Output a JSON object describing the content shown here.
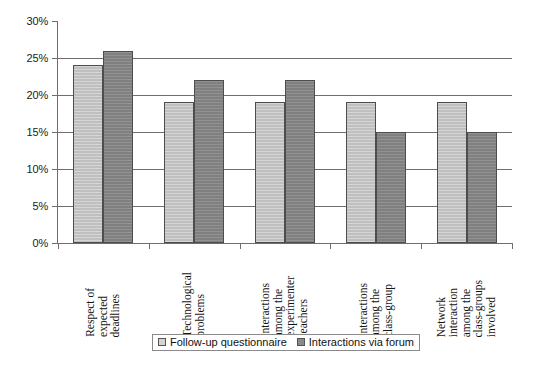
{
  "chart_data": {
    "type": "bar",
    "title": "",
    "subtitle": "",
    "xlabel": "",
    "ylabel": "",
    "ylim": [
      0,
      30
    ],
    "ytick_values": [
      30,
      25,
      20,
      15,
      10,
      5,
      0
    ],
    "ytick_labels": [
      "30%",
      "25%",
      "20%",
      "15%",
      "10%",
      "5%",
      "0%"
    ],
    "grid": true,
    "grid_axis": "y",
    "legend_position": "bottom",
    "categories": [
      "Respect of expected deadlines",
      "Technological problems",
      "Interactions among the experimenter teachers",
      "Interactions among the class-group",
      "Network interaction among the class-groups involved"
    ],
    "category_label_lines": [
      [
        "Respect of",
        "expected",
        "deadlines"
      ],
      [
        "Technological",
        "problems"
      ],
      [
        "Interactions",
        "among the",
        "experimenter",
        "teachers"
      ],
      [
        "Interactions",
        "among the",
        "class-group"
      ],
      [
        "Network",
        "interaction",
        "among the",
        "class-groups",
        "involved"
      ]
    ],
    "series": [
      {
        "name": "Follow-up questionnaire",
        "color": "#bfbfbf",
        "values": [
          24,
          19,
          19,
          19,
          19
        ]
      },
      {
        "name": "Interactions via forum",
        "color": "#808080",
        "values": [
          26,
          22,
          22,
          15,
          15
        ]
      }
    ]
  },
  "legend": {
    "items": [
      {
        "label": "Follow-up questionnaire",
        "series": 0
      },
      {
        "label": "Interactions via forum",
        "series": 1
      }
    ]
  },
  "colors": {
    "series_0": "#bfbfbf",
    "series_1": "#808080",
    "axis": "#6e6e6e",
    "grid": "#6e6e6e",
    "text": "#141414",
    "background": "#ffffff"
  }
}
